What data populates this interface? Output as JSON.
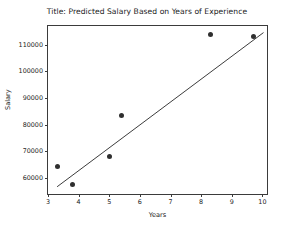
{
  "chart_data": {
    "type": "scatter",
    "title": "Title: Predicted Salary Based on Years of Experience",
    "xlabel": "Years",
    "ylabel": "Salary",
    "xlim": [
      3.0,
      10.15
    ],
    "ylim": [
      54000,
      117000
    ],
    "xticks": [
      3,
      4,
      5,
      6,
      7,
      8,
      9,
      10
    ],
    "xticklabels": [
      "3",
      "4",
      "5",
      "6",
      "7",
      "8",
      "9",
      "10"
    ],
    "yticks": [
      60000,
      70000,
      80000,
      90000,
      100000,
      110000
    ],
    "yticklabels": [
      "60000",
      "70000",
      "80000",
      "90000",
      "100000",
      "110000"
    ],
    "grid": false,
    "legend": null,
    "marker_color": "#2f2f2f",
    "line_color": "#3a3a3a",
    "points": [
      {
        "x": 3.3,
        "y": 64400
      },
      {
        "x": 3.8,
        "y": 57500
      },
      {
        "x": 5.0,
        "y": 68000
      },
      {
        "x": 5.4,
        "y": 83300
      },
      {
        "x": 8.3,
        "y": 114000
      },
      {
        "x": 9.7,
        "y": 113000
      }
    ],
    "series": [
      {
        "name": "Predicted salary (regression line)",
        "type": "line",
        "x": [
          3.3,
          10.1
        ],
        "values": [
          56000,
          114500
        ]
      }
    ]
  }
}
